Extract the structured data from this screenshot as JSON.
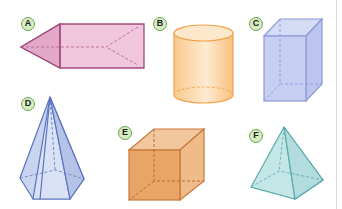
{
  "figure": {
    "shapes": [
      {
        "label": "A",
        "name": "pentagonal prism / triangular-pointed prism",
        "color": "#e7b4cf",
        "edge": "#a04a7a"
      },
      {
        "label": "B",
        "name": "cylinder",
        "color": "#fbd9ad",
        "edge": "#f1a24a"
      },
      {
        "label": "C",
        "name": "rectangular prism",
        "color": "#c3cbf0",
        "edge": "#8e9ad8"
      },
      {
        "label": "D",
        "name": "hexagonal pyramid",
        "color": "#c6d3ee",
        "edge": "#5c74bf"
      },
      {
        "label": "E",
        "name": "cube",
        "color": "#e8a566",
        "edge": "#c7793a"
      },
      {
        "label": "F",
        "name": "square pyramid",
        "color": "#bfe3e3",
        "edge": "#5aa9ac"
      }
    ],
    "label_badge_color": "#d7ecc2",
    "label_badge_border": "#6aa84f"
  }
}
